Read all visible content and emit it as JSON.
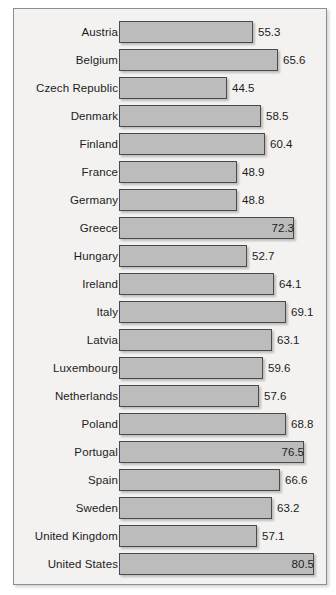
{
  "chart_data": {
    "type": "bar",
    "orientation": "horizontal",
    "title": "",
    "subtitle": "",
    "xlabel": "",
    "ylabel": "",
    "grid": false,
    "legend": null,
    "xlim": [
      0,
      85
    ],
    "value_precision": 1,
    "categories": [
      "Austria",
      "Belgium",
      "Czech Republic",
      "Denmark",
      "Finland",
      "France",
      "Germany",
      "Greece",
      "Hungary",
      "Ireland",
      "Italy",
      "Latvia",
      "Luxembourg",
      "Netherlands",
      "Poland",
      "Portugal",
      "Spain",
      "Sweden",
      "United Kingdom",
      "United States"
    ],
    "values": [
      55.3,
      65.6,
      44.5,
      58.5,
      60.4,
      48.9,
      48.8,
      72.3,
      52.7,
      64.1,
      69.1,
      63.1,
      59.6,
      57.6,
      68.8,
      76.5,
      66.6,
      63.2,
      57.1,
      80.5
    ],
    "labels": [
      "55.3",
      "65.6",
      "44.5",
      "58.5",
      "60.4",
      "48.9",
      "48.8",
      "72.3",
      "52.7",
      "64.1",
      "69.1",
      "63.1",
      "59.6",
      "57.6",
      "68.8",
      "76.5",
      "66.6",
      "63.2",
      "57.1",
      "80.5"
    ],
    "label_placement": [
      "outside",
      "outside",
      "outside",
      "outside",
      "outside",
      "outside",
      "outside",
      "inside",
      "outside",
      "outside",
      "outside",
      "outside",
      "outside",
      "outside",
      "outside",
      "inside",
      "outside",
      "outside",
      "outside",
      "inside"
    ]
  },
  "style": {
    "bar_fill": "#bcbcbc",
    "bar_border": "#4a4a4a",
    "panel_background": "#f3f2f0",
    "panel_border": "#8e8e8e",
    "text_color": "#1c1c1c"
  }
}
